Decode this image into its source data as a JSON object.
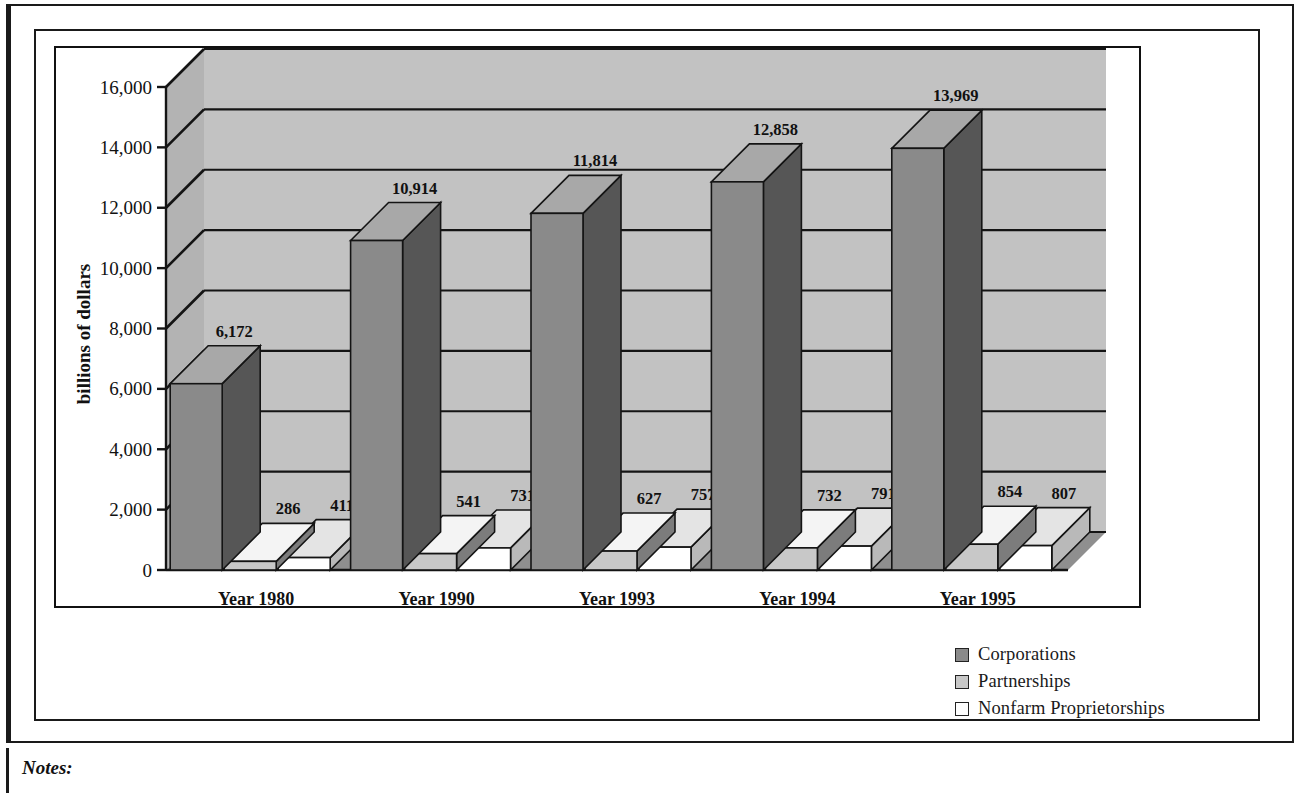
{
  "figure": {
    "notes_label": "Notes:",
    "axis_title": "billions of dollars"
  },
  "legend": {
    "items": [
      {
        "label": "Corporations",
        "color": "#8a8a8a",
        "swatch_name": "legend-swatch-corporations"
      },
      {
        "label": "Partnerships",
        "color": "#c8c8c8",
        "swatch_name": "legend-swatch-partnerships"
      },
      {
        "label": "Nonfarm Proprietorships",
        "color": "#ffffff",
        "swatch_name": "legend-swatch-nonfarm"
      }
    ]
  },
  "chart_data": {
    "type": "bar",
    "title": "",
    "xlabel": "",
    "ylabel": "billions of dollars",
    "ylim": [
      0,
      16000
    ],
    "yticks": [
      0,
      2000,
      4000,
      6000,
      8000,
      10000,
      12000,
      14000,
      16000
    ],
    "ytick_labels": [
      "0",
      "2,000",
      "4,000",
      "6,000",
      "8,000",
      "10,000",
      "12,000",
      "14,000",
      "16,000"
    ],
    "grid": true,
    "legend_position": "bottom-right",
    "three_d": true,
    "categories": [
      "Year 1980",
      "Year 1990",
      "Year 1993",
      "Year 1994",
      "Year 1995"
    ],
    "series": [
      {
        "name": "Corporations",
        "color": "#8a8a8a",
        "values": [
          6172,
          10914,
          11814,
          12858,
          13969
        ],
        "labels": [
          "6,172",
          "10,914",
          "11,814",
          "12,858",
          "13,969"
        ]
      },
      {
        "name": "Partnerships",
        "color": "#c8c8c8",
        "values": [
          286,
          541,
          627,
          732,
          854
        ],
        "labels": [
          "286",
          "541",
          "627",
          "732",
          "854"
        ]
      },
      {
        "name": "Nonfarm Proprietorships",
        "color": "#ffffff",
        "values": [
          411,
          731,
          757,
          791,
          807
        ],
        "labels": [
          "411",
          "731",
          "757",
          "791",
          "807"
        ]
      }
    ]
  }
}
